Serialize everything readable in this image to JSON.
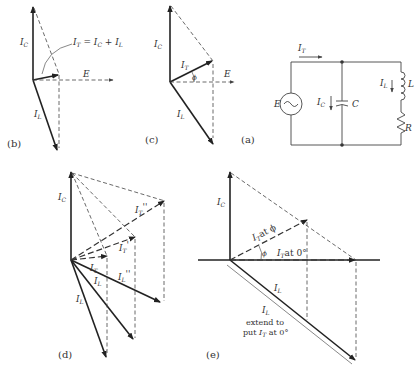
{
  "figure": {
    "panels": {
      "a": {
        "caption": "(a)",
        "source_label": "E",
        "total_current_label": "I",
        "total_current_sub": "T",
        "capacitor_current_label": "I",
        "capacitor_current_sub": "C",
        "capacitor_label": "C",
        "inductor_current_label": "I",
        "inductor_current_sub": "L",
        "inductor_label": "L",
        "resistor_label": "R"
      },
      "b": {
        "caption": "(b)",
        "ic_label": "I",
        "ic_sub": "C",
        "il_label": "I",
        "il_sub": "L",
        "e_label": "E",
        "equation": "I_T = I_C + I_L",
        "eq_parts": [
          "I",
          "T",
          " = I",
          "C",
          " + I",
          "L"
        ]
      },
      "c": {
        "caption": "(c)",
        "ic_label": "I",
        "ic_sub": "C",
        "it_label": "I",
        "it_sub": "T",
        "il_label": "I",
        "il_sub": "L",
        "e_label": "E",
        "phi_label": "ϕ"
      },
      "d": {
        "caption": "(d)",
        "ic_label": "I",
        "ic_sub": "C",
        "it_labels": [
          "I_T",
          "I_T'",
          "I_T''"
        ],
        "it_main": "I",
        "it_sub": "T",
        "it_prime": "'",
        "it_dprime": "''",
        "il_main": "I",
        "il_sub": "L",
        "il_dprime": "''"
      },
      "e": {
        "caption": "(e)",
        "ic_label": "I",
        "ic_sub": "C",
        "it_phi_text": "at ϕ",
        "it_zero_text": "at 0°",
        "phi_label": "ϕ",
        "il_label": "I",
        "il_sub": "L",
        "extend_line1": "extend to",
        "extend_line2_pre": "put",
        "extend_line2_post": "at 0°"
      }
    }
  }
}
